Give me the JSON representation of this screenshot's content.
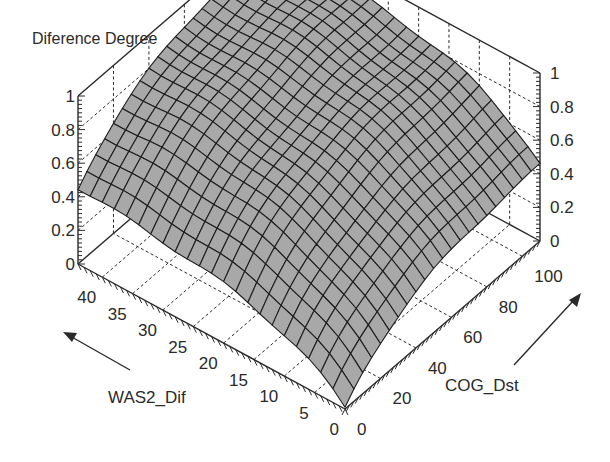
{
  "chart_data": {
    "type": "surface3d",
    "title": "Diference Degree",
    "xlabel": "WAS2_Dif",
    "ylabel": "COG_Dst",
    "zlabel": "Diference Degree",
    "x_range": [
      0,
      44
    ],
    "y_range": [
      0,
      110
    ],
    "z_range": [
      0,
      1
    ],
    "x_ticks": [
      0,
      5,
      10,
      15,
      20,
      25,
      30,
      35,
      40
    ],
    "y_ticks": [
      0,
      20,
      40,
      60,
      80,
      100
    ],
    "z_ticks": [
      0,
      0.2,
      0.4,
      0.6,
      0.8,
      1
    ],
    "z_tick_labels": [
      "0",
      "0.2",
      "0.4",
      "0.6",
      "0.8",
      "1"
    ],
    "grid": true,
    "surface_color": "#a8a8a8",
    "edge_color": "#1e1e1e",
    "grid_resolution": {
      "nx": 22,
      "ny": 22
    },
    "surface_description": "Difference degree rises from ~0 at (WAS2_Dif=0, COG_Dst=0) to ~0.97 at maximum WAS2_Dif and COG_Dst; ~0.47 along far edge at WAS2_Dif=44, COG_Dst=0 and ~0.45 at WAS2_Dif=0, COG_Dst=110",
    "sample_points": [
      {
        "x": 0,
        "y": 0,
        "z": 0.0
      },
      {
        "x": 44,
        "y": 0,
        "z": 0.47
      },
      {
        "x": 0,
        "y": 110,
        "z": 0.45
      },
      {
        "x": 44,
        "y": 110,
        "z": 0.97
      },
      {
        "x": 22,
        "y": 55,
        "z": 0.72
      },
      {
        "x": 10,
        "y": 20,
        "z": 0.35
      },
      {
        "x": 30,
        "y": 80,
        "z": 0.88
      }
    ]
  },
  "annotations": {
    "x_arrow": "WAS2_Dif",
    "y_arrow": "COG_Dst"
  }
}
